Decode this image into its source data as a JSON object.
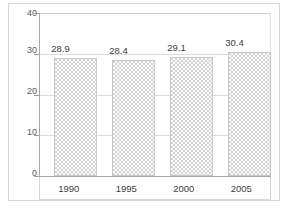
{
  "chart_data": {
    "type": "bar",
    "title": "",
    "subtitle": "",
    "xlabel": "",
    "ylabel": "",
    "categories": [
      "1990",
      "1995",
      "2000",
      "2005"
    ],
    "values": [
      28.9,
      28.4,
      29.1,
      30.4
    ],
    "data_labels": [
      "28.9",
      "28.4",
      "29.1",
      "30.4"
    ],
    "ylim": [
      0,
      40
    ],
    "ytick_labels": [
      "0",
      "10",
      "20",
      "30",
      "40"
    ],
    "ytick_values": [
      0,
      10,
      20,
      30,
      40
    ],
    "grid": true,
    "grid_axis": "y",
    "legend": false,
    "legend_position": "none",
    "series": [
      {
        "name": "",
        "values": [
          28.9,
          28.4,
          29.1,
          30.4
        ]
      }
    ],
    "colors": {
      "bar_fill": "#d5d5d5",
      "bar_border": "#c9c9c9",
      "gridline": "#dcdcdc",
      "axis": "#a8a8a8",
      "tick_label": "#5a5a5a",
      "data_label": "#3d3d3d",
      "background": "#ffffff",
      "frame": "#d8d8d8"
    }
  }
}
